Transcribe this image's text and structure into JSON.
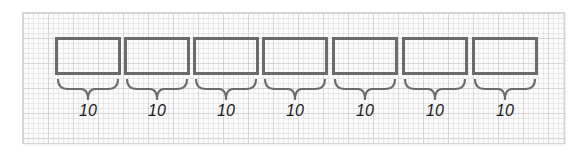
{
  "diagram": {
    "colors": {
      "box_border": "#6b6b6b",
      "brace": "#6b6b6b",
      "label": "#1a1a1a",
      "grid_background": "#fbfbfb",
      "frame_border": "#d4d4d4"
    },
    "segments": [
      {
        "label": "10"
      },
      {
        "label": "10"
      },
      {
        "label": "10"
      },
      {
        "label": "10"
      },
      {
        "label": "10"
      },
      {
        "label": "10"
      },
      {
        "label": "10"
      }
    ]
  }
}
